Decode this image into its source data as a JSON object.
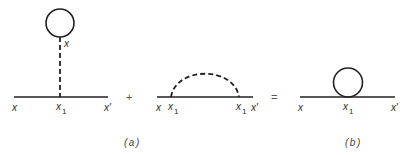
{
  "colors": {
    "line": "#222222",
    "text": "#2a2a2a",
    "background": "#ffffff"
  },
  "diagram_a_tadpole": {
    "labels": {
      "vertex_top": "x",
      "left_end": "x",
      "vertex": "x",
      "vertex_sub": "1",
      "right_end": "x′"
    }
  },
  "operator_plus": "+",
  "diagram_a_sunset": {
    "labels": {
      "left_end": "x",
      "vertex_left": "x",
      "vertex_left_sub": "1",
      "vertex_right": "x",
      "vertex_right_sub": "1",
      "right_end": "x′"
    }
  },
  "operator_equals": "=",
  "diagram_b": {
    "labels": {
      "left_end": "x",
      "vertex": "x",
      "vertex_sub": "1",
      "right_end": "x′"
    }
  },
  "captions": {
    "a": "(a)",
    "b": "(b)"
  }
}
